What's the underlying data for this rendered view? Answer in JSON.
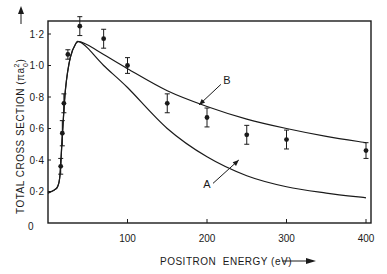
{
  "chart_data": {
    "type": "line",
    "title": "",
    "xlabel": "POSITRON ENERGY (eV)",
    "ylabel": "TOTAL CROSS SECTION (πa₀²)",
    "xlim": [
      0,
      410
    ],
    "ylim": [
      0,
      1.3
    ],
    "x_ticks": [
      0,
      100,
      200,
      300,
      400
    ],
    "x_tick_labels": [
      "100",
      "200",
      "300",
      "400"
    ],
    "y_ticks": [
      0,
      0.2,
      0.4,
      0.6,
      0.8,
      1.0,
      1.2
    ],
    "y_tick_labels": [
      "0",
      "0·2",
      "0·4",
      "0·6",
      "0·8",
      "1·0",
      "1·2"
    ],
    "grid": false,
    "legend": "none (curves labelled A and B with arrows)",
    "series": [
      {
        "name": "Experiment",
        "style": "points with error bars",
        "x": [
          16,
          18,
          20,
          25,
          40,
          70,
          100,
          150,
          200,
          250,
          300,
          400
        ],
        "y": [
          0.36,
          0.57,
          0.76,
          1.07,
          1.25,
          1.17,
          1.0,
          0.76,
          0.67,
          0.56,
          0.53,
          0.46
        ],
        "err": [
          0.05,
          0.08,
          0.06,
          0.03,
          0.06,
          0.06,
          0.05,
          0.06,
          0.06,
          0.06,
          0.06,
          0.05
        ]
      },
      {
        "name": "B",
        "style": "solid line",
        "x": [
          0,
          8,
          12,
          15,
          18,
          22,
          28,
          35,
          40,
          50,
          70,
          100,
          150,
          200,
          250,
          300,
          350,
          400
        ],
        "y": [
          0.19,
          0.21,
          0.23,
          0.3,
          0.55,
          0.85,
          1.05,
          1.14,
          1.15,
          1.13,
          1.07,
          0.98,
          0.84,
          0.74,
          0.66,
          0.6,
          0.55,
          0.51
        ]
      },
      {
        "name": "A",
        "style": "solid line",
        "x": [
          0,
          8,
          12,
          15,
          18,
          22,
          28,
          35,
          40,
          50,
          70,
          100,
          150,
          200,
          250,
          300,
          350,
          400
        ],
        "y": [
          0.19,
          0.21,
          0.23,
          0.3,
          0.55,
          0.85,
          1.05,
          1.14,
          1.15,
          1.11,
          1.0,
          0.86,
          0.6,
          0.42,
          0.3,
          0.23,
          0.19,
          0.16
        ]
      }
    ],
    "annotations": [
      {
        "text": "A",
        "x": 200,
        "y": 0.22,
        "arrow_to": {
          "x": 240,
          "y": 0.4
        }
      },
      {
        "text": "B",
        "x": 225,
        "y": 0.88,
        "arrow_to": {
          "x": 190,
          "y": 0.75
        }
      }
    ]
  },
  "labels": {
    "x_axis": "POSITRON  ENERGY (eV)",
    "y_axis": "TOTAL CROSS SECTION (πa",
    "y_axis_sub": "0",
    "y_axis_sup": "2",
    "y_axis_close": ")",
    "origin": "0",
    "curve_a": "A",
    "curve_b": "B"
  }
}
